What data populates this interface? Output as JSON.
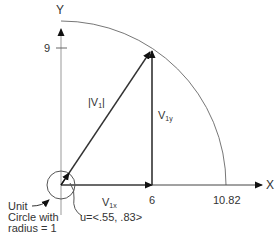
{
  "diagram": {
    "axes": {
      "x_label": "X",
      "y_label": "Y"
    },
    "ticks": {
      "y_tick": "9",
      "x_tick_vertical": "6",
      "x_tick_arc": "10.82"
    },
    "vectors": {
      "magnitude_label_prefix": "|V",
      "magnitude_label_sub": "1",
      "magnitude_label_suffix": "|",
      "vy_label_main": "V",
      "vy_label_sub": "1y",
      "vx_label_main": "V",
      "vx_label_sub": "1x"
    },
    "unit_vector": {
      "label": "u=<.55, .83>"
    },
    "unit_circle": {
      "line1": "Unit",
      "line2": "Circle with",
      "line3": "radius = 1"
    },
    "colors": {
      "line": "#333333",
      "axis": "#888888",
      "arc": "#777777",
      "text": "#333333"
    }
  }
}
